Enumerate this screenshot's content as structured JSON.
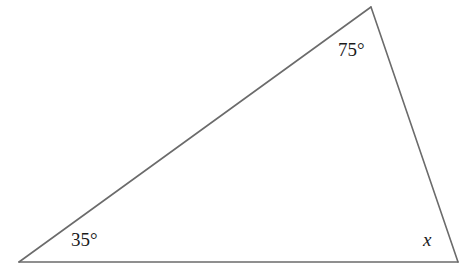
{
  "diagram": {
    "type": "triangle",
    "vertices": {
      "top": {
        "x": 371,
        "y": 7
      },
      "bottom_left": {
        "x": 19,
        "y": 262
      },
      "bottom_right": {
        "x": 458,
        "y": 262
      }
    },
    "angles": {
      "top": {
        "label": "75°",
        "value": 75
      },
      "bottom_left": {
        "label": "35°",
        "value": 35
      },
      "bottom_right": {
        "label": "x",
        "value": null
      }
    },
    "colors": {
      "line": "#6b6b6b",
      "text": "#1a1a1a",
      "background": "#ffffff"
    }
  }
}
